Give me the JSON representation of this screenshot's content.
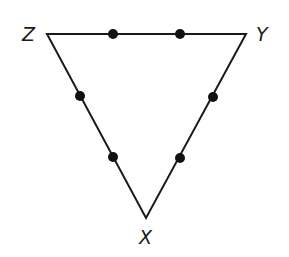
{
  "diagram": {
    "type": "triangle",
    "vertices": [
      {
        "label": "Z",
        "x": 47,
        "y": 34
      },
      {
        "label": "Y",
        "x": 246,
        "y": 34
      },
      {
        "label": "X",
        "x": 146,
        "y": 218
      }
    ],
    "labels": {
      "z": "Z",
      "y": "Y",
      "x": "X"
    },
    "points_per_side": 2,
    "points": [
      {
        "side": "ZY",
        "x": 113,
        "y": 34
      },
      {
        "side": "ZY",
        "x": 180,
        "y": 34
      },
      {
        "side": "ZX",
        "x": 80,
        "y": 96
      },
      {
        "side": "ZX",
        "x": 113,
        "y": 157
      },
      {
        "side": "YX",
        "x": 213,
        "y": 97
      },
      {
        "side": "YX",
        "x": 180,
        "y": 158
      }
    ],
    "colors": {
      "line": "#1a1a1a",
      "point": "#111111",
      "background": "#ffffff"
    }
  }
}
